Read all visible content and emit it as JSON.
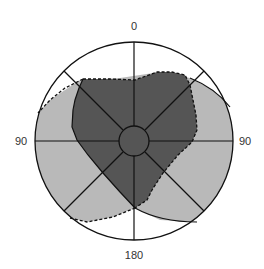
{
  "diagram": {
    "type": "polar-field-map",
    "labels": {
      "top": "0",
      "bottom": "180",
      "left": "90",
      "right": "90"
    },
    "colors": {
      "dark_region": "#555555",
      "light_region": "#b9b9b9",
      "outline": "#111111",
      "background": "#ffffff"
    },
    "regions": [
      {
        "name": "dark-central-region",
        "fill": "dark",
        "border": "solid left, dashed top/right"
      },
      {
        "name": "light-outer-region",
        "fill": "light",
        "border": "dashed left/bottom-left, solid right/bottom-right"
      }
    ],
    "spokes": 8,
    "center_circle": true
  }
}
